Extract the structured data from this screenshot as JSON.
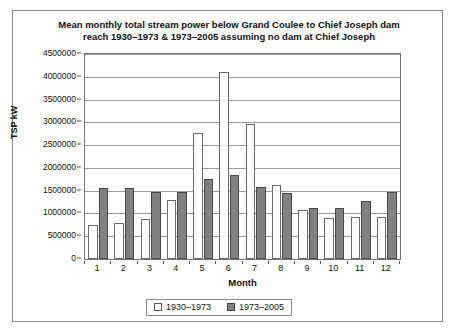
{
  "chart_data": {
    "type": "bar",
    "title": "Mean monthly total stream power below Grand Coulee to Chief Joseph dam reach 1930–1973 & 1973–2005 assuming no dam at Chief Joseph",
    "title_lines": [
      "Mean monthly total stream power below Grand Coulee to Chief Joseph dam",
      "reach 1930–1973 & 1973–2005 assuming no dam at Chief Joseph"
    ],
    "xlabel": "Month",
    "ylabel": "TSP kW",
    "categories": [
      "1",
      "2",
      "3",
      "4",
      "5",
      "6",
      "7",
      "8",
      "9",
      "10",
      "11",
      "12"
    ],
    "series": [
      {
        "name": "1930–1973",
        "color": "#ffffff",
        "values": [
          750000,
          800000,
          870000,
          1290000,
          2770000,
          4110000,
          2970000,
          1620000,
          1070000,
          890000,
          930000,
          930000
        ]
      },
      {
        "name": "1973–2005",
        "color": "#808080",
        "values": [
          1560000,
          1560000,
          1480000,
          1480000,
          1760000,
          1840000,
          1590000,
          1450000,
          1130000,
          1120000,
          1270000,
          1470000
        ]
      }
    ],
    "ylim": [
      0,
      4500000
    ],
    "ytick_step": 500000,
    "yticks": [
      0,
      500000,
      1000000,
      1500000,
      2000000,
      2500000,
      3000000,
      3500000,
      4000000,
      4500000
    ],
    "ytick_labels": [
      "0",
      "500000",
      "1000000",
      "1500000",
      "2000000",
      "2500000",
      "3000000",
      "3500000",
      "4000000",
      "4500000"
    ],
    "grid": true,
    "legend_position": "bottom-center"
  },
  "legend": {
    "entries": [
      {
        "label": "1930–1973"
      },
      {
        "label": "1973–2005"
      }
    ]
  }
}
